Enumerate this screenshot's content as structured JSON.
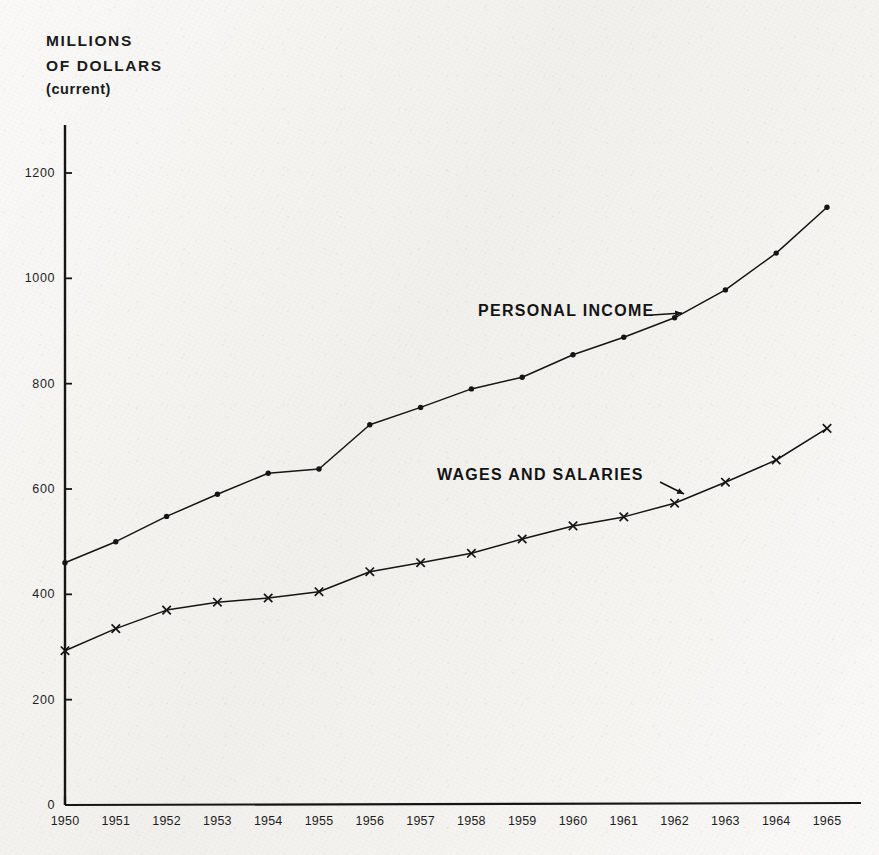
{
  "title": {
    "line1": "MILLIONS",
    "line2": "OF DOLLARS",
    "line3": "(current)"
  },
  "colors": {
    "ink": "#1b1b1b",
    "paper": "#f4f3f0",
    "axis": "#151515"
  },
  "chart_data": {
    "type": "line",
    "title": "MILLIONS OF DOLLARS (current)",
    "xlabel": "",
    "ylabel": "MILLIONS OF DOLLARS (current)",
    "grid": false,
    "legend_position": "inline-annotations",
    "categories": [
      "1950",
      "1951",
      "1952",
      "1953",
      "1954",
      "1955",
      "1956",
      "1957",
      "1958",
      "1959",
      "1960",
      "1961",
      "1962",
      "1963",
      "1964",
      "1965"
    ],
    "x": [
      1950,
      1951,
      1952,
      1953,
      1954,
      1955,
      1956,
      1957,
      1958,
      1959,
      1960,
      1961,
      1962,
      1963,
      1964,
      1965
    ],
    "xlim": [
      1950,
      1965
    ],
    "ylim": [
      0,
      1200
    ],
    "yticks": [
      0,
      200,
      400,
      600,
      800,
      1000,
      1200
    ],
    "ytick_labels": [
      "0",
      "200",
      "400",
      "600",
      "800",
      "1000",
      "1200"
    ],
    "xticks": [
      1950,
      1951,
      1952,
      1953,
      1954,
      1955,
      1956,
      1957,
      1958,
      1959,
      1960,
      1961,
      1962,
      1963,
      1964,
      1965
    ],
    "xtick_labels": [
      "1950",
      "1951",
      "1952",
      "1953",
      "1954",
      "1955",
      "1956",
      "1957",
      "1958",
      "1959",
      "1960",
      "1961",
      "1962",
      "1963",
      "1964",
      "1965"
    ],
    "series": [
      {
        "name": "PERSONAL INCOME",
        "marker": "filled-dot",
        "values": [
          460,
          500,
          548,
          590,
          630,
          638,
          722,
          755,
          790,
          812,
          855,
          888,
          925,
          978,
          1048,
          1135
        ]
      },
      {
        "name": "WAGES AND SALARIES",
        "marker": "x-cross",
        "values": [
          293,
          335,
          370,
          385,
          393,
          405,
          443,
          460,
          478,
          505,
          530,
          547,
          573,
          613,
          655,
          715
        ]
      }
    ],
    "annotations": [
      {
        "text": "PERSONAL INCOME",
        "series": "PERSONAL INCOME",
        "arrow": "right"
      },
      {
        "text": "WAGES AND SALARIES",
        "series": "WAGES AND SALARIES",
        "arrow": "down-right"
      }
    ]
  }
}
